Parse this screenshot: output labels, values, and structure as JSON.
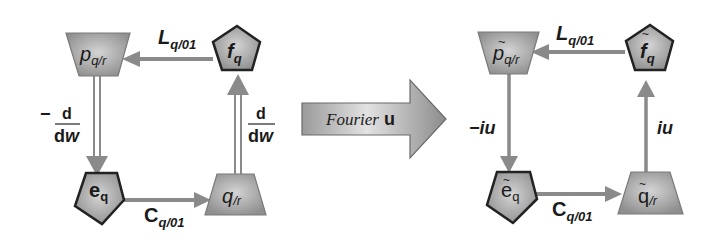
{
  "colors": {
    "shape_fill_light": "#bdbdbd",
    "shape_fill_dark": "#8e8e8e",
    "shape_stroke_pentagon": "#222222",
    "shape_stroke_trapezoid": "#7a7a7a",
    "arrow_color": "#8a8a8a",
    "text": "#1a1a1a",
    "background": "#ffffff"
  },
  "left_diagram": {
    "nodes": {
      "top_left": {
        "shape": "trapezoid",
        "symbol": "p",
        "subscript": "q/r"
      },
      "top_right": {
        "shape": "pentagon",
        "symbol": "f",
        "subscript": "q"
      },
      "bottom_left": {
        "shape": "pentagon",
        "symbol": "e",
        "subscript": "q"
      },
      "bottom_right": {
        "shape": "trapezoid",
        "symbol": "q",
        "subscript": "/r"
      }
    },
    "edges": {
      "top": {
        "label_main": "L",
        "label_sub": "q/01",
        "direction": "right-to-left",
        "style": "single"
      },
      "bottom": {
        "label_main": "C",
        "label_sub": "q/01",
        "direction": "left-to-right",
        "style": "single"
      },
      "left": {
        "sign": "−",
        "numerator": "d",
        "denominator_d": "d",
        "denominator_var": "w",
        "direction": "down",
        "style": "double"
      },
      "right": {
        "numerator": "d",
        "denominator_d": "d",
        "denominator_var": "w",
        "direction": "up",
        "style": "double"
      }
    }
  },
  "transform_arrow": {
    "label_word": "Fourier",
    "label_var": "u"
  },
  "right_diagram": {
    "nodes": {
      "top_left": {
        "shape": "trapezoid",
        "symbol": "p",
        "tilde": "~",
        "subscript": "q/r"
      },
      "top_right": {
        "shape": "pentagon",
        "symbol": "f",
        "tilde": "~",
        "subscript": "q"
      },
      "bottom_left": {
        "shape": "pentagon",
        "symbol": "e",
        "tilde": "~",
        "subscript": "q"
      },
      "bottom_right": {
        "shape": "trapezoid",
        "symbol": "q",
        "tilde": "~",
        "subscript": "/r"
      }
    },
    "edges": {
      "top": {
        "label_main": "L",
        "label_sub": "q/01",
        "direction": "right-to-left"
      },
      "bottom": {
        "label_main": "C",
        "label_sub": "q/01",
        "direction": "left-to-right"
      },
      "left": {
        "label": "−iu",
        "direction": "down"
      },
      "right": {
        "label": "iu",
        "direction": "up"
      }
    }
  }
}
